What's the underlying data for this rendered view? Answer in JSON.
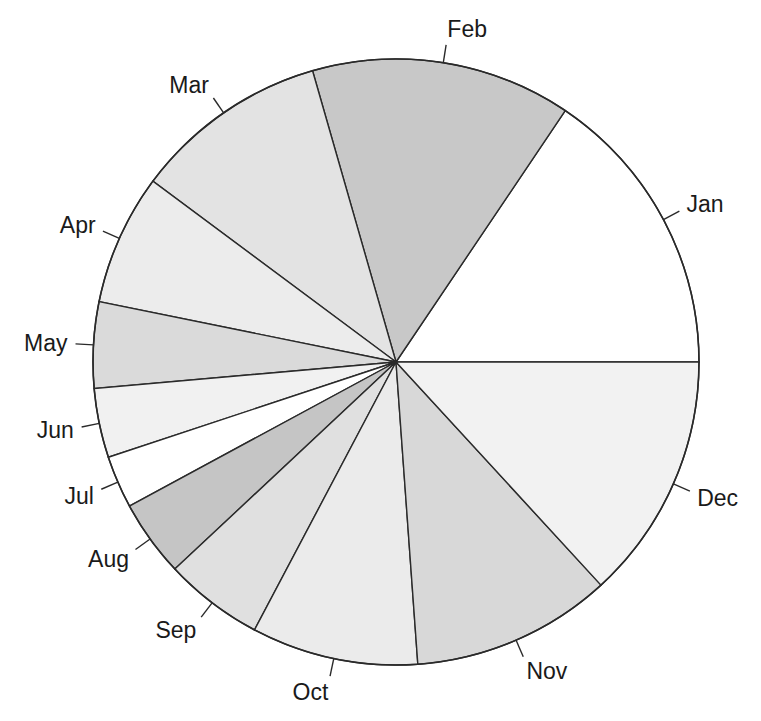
{
  "chart_data": {
    "type": "pie",
    "title": "",
    "categories": [
      "Jan",
      "Feb",
      "Mar",
      "Apr",
      "May",
      "Jun",
      "Jul",
      "Aug",
      "Sep",
      "Oct",
      "Nov",
      "Dec"
    ],
    "values": [
      15.6,
      13.9,
      10.4,
      7.0,
      4.6,
      3.7,
      2.8,
      4.1,
      5.3,
      8.9,
      10.7,
      13.2
    ],
    "colors": [
      "#ffffff",
      "#c8c8c8",
      "#e3e3e3",
      "#ececec",
      "#dadada",
      "#f1f1f1",
      "#ffffff",
      "#c5c5c5",
      "#e0e0e0",
      "#ebebeb",
      "#d8d8d8",
      "#f2f2f2"
    ],
    "start_angle_deg": 0,
    "direction": "counterclockwise",
    "legend": "none",
    "labels_outside_with_ticks": true
  },
  "geometry": {
    "cx": 396,
    "cy": 362,
    "r": 303
  }
}
